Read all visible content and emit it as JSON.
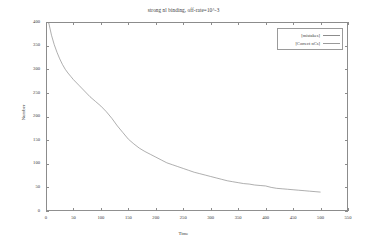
{
  "chart_data": {
    "type": "line",
    "title": "strong nl binding, off-rate=10^-3",
    "xlabel": "Time",
    "ylabel": "Number",
    "xlim": [
      0,
      550
    ],
    "ylim": [
      0,
      400
    ],
    "xticks": [
      0,
      50,
      100,
      150,
      200,
      250,
      300,
      350,
      400,
      450,
      500,
      550
    ],
    "yticks": [
      0,
      50,
      100,
      150,
      200,
      250,
      300,
      350,
      400
    ],
    "grid": false,
    "legend_position": "top-right",
    "legend": [
      "[mistakes]",
      "[Correct nCs]"
    ],
    "series": [
      {
        "name": "[mistakes]",
        "color": "#8c8c8c",
        "x": [
          0,
          5,
          10,
          15,
          20,
          25,
          30,
          35,
          40,
          45,
          50,
          60,
          70,
          80,
          90,
          100,
          110,
          120,
          130,
          140,
          150,
          160,
          170,
          180,
          190,
          200,
          210,
          220,
          230,
          240,
          250,
          260,
          270,
          280,
          290,
          300,
          310,
          320,
          330,
          340,
          350,
          360,
          370,
          380,
          390,
          400,
          410,
          420,
          430,
          440,
          450,
          460,
          470,
          480,
          490,
          500
        ],
        "y": [
          400,
          398,
          372,
          352,
          336,
          322,
          310,
          300,
          292,
          285,
          278,
          266,
          254,
          242,
          232,
          222,
          210,
          196,
          180,
          166,
          152,
          142,
          133,
          126,
          120,
          114,
          108,
          102,
          98,
          94,
          90,
          86,
          82,
          79,
          76,
          73,
          70,
          67,
          64,
          62,
          60,
          58,
          57,
          55,
          54,
          53,
          50,
          48,
          47,
          46,
          45,
          44,
          43,
          42,
          41,
          40
        ]
      },
      {
        "name": "[Correct nCs]",
        "color": "#9a9a9a",
        "x": [
          0,
          50,
          100,
          150,
          200,
          250,
          300,
          350,
          400,
          450,
          500
        ],
        "y": [
          0,
          0,
          0,
          0,
          0,
          0,
          0,
          0,
          0,
          0,
          0
        ]
      }
    ]
  }
}
